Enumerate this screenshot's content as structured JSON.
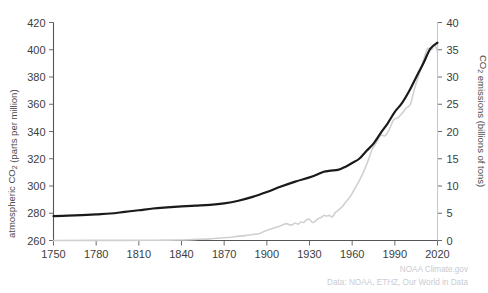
{
  "figure": {
    "background_color": "#ffffff",
    "ghost_title_fragment": "",
    "credit_line_1": "NOAA Climate.gov",
    "credit_line_2": "Data: NOAA, ETHZ, Our World in Data",
    "credit_color": "#c9ccd1"
  },
  "chart_data": {
    "type": "line",
    "title": "",
    "xlabel": "",
    "ylabel": "atmospheric CO₂ (parts per million)",
    "y2label": "CO₂ emissions (billions of tons)",
    "xlim": [
      1750,
      2020
    ],
    "ylim": [
      260,
      420
    ],
    "y2lim": [
      0,
      40
    ],
    "xticks": [
      1750,
      1780,
      1810,
      1840,
      1870,
      1900,
      1930,
      1960,
      1990,
      2020
    ],
    "xticklabels": [
      "1750",
      "1780",
      "1810",
      "1840",
      "1870",
      "1900",
      "1930",
      "1960",
      "1990",
      "2020"
    ],
    "yticks": [
      260,
      280,
      300,
      320,
      340,
      360,
      380,
      400,
      420
    ],
    "yticklabels": [
      "260",
      "280",
      "300",
      "320",
      "340",
      "360",
      "380",
      "400",
      "420"
    ],
    "y2ticks": [
      0,
      5,
      10,
      15,
      20,
      25,
      30,
      35,
      40
    ],
    "y2ticklabels": [
      "0",
      "5",
      "10",
      "15",
      "20",
      "25",
      "30",
      "35",
      "40"
    ],
    "grid": false,
    "legend": "none",
    "series": [
      {
        "name": "atmospheric CO2",
        "axis": "left",
        "color": "#1a1a1a",
        "linewidth": 2.2,
        "x": [
          1750,
          1760,
          1770,
          1780,
          1790,
          1800,
          1810,
          1820,
          1830,
          1840,
          1850,
          1860,
          1870,
          1880,
          1890,
          1900,
          1910,
          1920,
          1930,
          1935,
          1940,
          1945,
          1950,
          1955,
          1960,
          1965,
          1970,
          1975,
          1980,
          1985,
          1990,
          1995,
          2000,
          2005,
          2010,
          2015,
          2020
        ],
        "y": [
          277.9,
          278.2,
          278.6,
          279.2,
          279.8,
          281.0,
          282.2,
          283.5,
          284.3,
          285.0,
          285.6,
          286.2,
          287.3,
          289.2,
          292.0,
          295.6,
          299.6,
          303.2,
          306.3,
          308.3,
          310.5,
          311.3,
          311.8,
          314.0,
          316.9,
          320.0,
          325.7,
          331.1,
          338.8,
          346.0,
          354.4,
          360.8,
          369.5,
          379.8,
          389.9,
          400.8,
          405.2
        ]
      },
      {
        "name": "CO2 emissions",
        "axis": "right",
        "color": "#d0d0d0",
        "linewidth": 1.6,
        "x": [
          1750,
          1800,
          1820,
          1840,
          1850,
          1860,
          1870,
          1875,
          1880,
          1885,
          1890,
          1895,
          1900,
          1903,
          1906,
          1909,
          1912,
          1914,
          1916,
          1918,
          1920,
          1922,
          1924,
          1926,
          1928,
          1930,
          1932,
          1934,
          1936,
          1938,
          1940,
          1942,
          1944,
          1946,
          1948,
          1950,
          1953,
          1956,
          1959,
          1962,
          1965,
          1968,
          1971,
          1974,
          1977,
          1980,
          1983,
          1986,
          1989,
          1992,
          1995,
          1998,
          2001,
          2004,
          2007,
          2010,
          2013,
          2016,
          2018,
          2020
        ],
        "y": [
          0.01,
          0.03,
          0.05,
          0.09,
          0.2,
          0.3,
          0.5,
          0.6,
          0.8,
          0.9,
          1.1,
          1.3,
          1.9,
          2.1,
          2.4,
          2.6,
          3.0,
          3.1,
          2.9,
          2.9,
          3.2,
          3.0,
          3.4,
          3.3,
          3.8,
          3.9,
          3.3,
          3.5,
          4.0,
          4.2,
          4.6,
          4.5,
          4.6,
          4.3,
          5.1,
          5.5,
          6.2,
          7.2,
          8.2,
          9.6,
          11.0,
          12.6,
          14.5,
          16.7,
          18.0,
          19.3,
          19.2,
          20.3,
          22.1,
          22.5,
          23.3,
          24.3,
          25.0,
          28.0,
          30.5,
          33.0,
          35.2,
          35.0,
          36.0,
          34.6
        ]
      }
    ]
  },
  "axes": {
    "spine_color": "#555555",
    "right_spine_color": "#c8c8c8",
    "tick_color": "#6b6b6b",
    "tick_label_color": "#3d3d3d"
  }
}
